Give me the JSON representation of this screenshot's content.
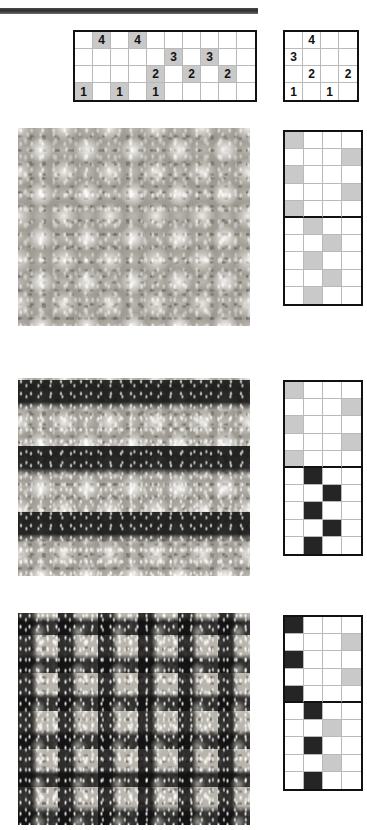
{
  "page": {
    "top_rule": "decorative-horizontal-rule"
  },
  "charts": {
    "main": {
      "name": "stitch-chart-main",
      "columns": 10,
      "rows": 4,
      "cells": [
        [
          "",
          "4",
          "",
          "4",
          "",
          "",
          "",
          "",
          "",
          ""
        ],
        [
          "",
          "",
          "",
          "",
          "",
          "3",
          "",
          "3",
          "",
          ""
        ],
        [
          "",
          "",
          "",
          "",
          "2",
          "",
          "2",
          "",
          "2",
          ""
        ],
        [
          "1",
          "",
          "1",
          "",
          "1",
          "",
          "",
          "",
          "",
          ""
        ]
      ],
      "shaded": [
        [
          0,
          1,
          0,
          1,
          0,
          0,
          0,
          0,
          0,
          0
        ],
        [
          0,
          0,
          0,
          0,
          0,
          1,
          0,
          1,
          0,
          0
        ],
        [
          0,
          0,
          0,
          0,
          1,
          0,
          1,
          0,
          1,
          0
        ],
        [
          1,
          0,
          1,
          0,
          1,
          0,
          0,
          0,
          0,
          0
        ]
      ]
    },
    "side": {
      "name": "stitch-chart-repeat",
      "columns": 4,
      "rows": 4,
      "cells": [
        [
          "",
          "4",
          "",
          ""
        ],
        [
          "3",
          "",
          "",
          ""
        ],
        [
          "",
          "2",
          "",
          "2"
        ],
        [
          "1",
          "",
          "1",
          ""
        ]
      ],
      "shaded": [
        [
          0,
          0,
          0,
          0
        ],
        [
          0,
          0,
          0,
          0
        ],
        [
          0,
          0,
          0,
          0
        ],
        [
          0,
          0,
          0,
          0
        ]
      ]
    },
    "pattern_a": {
      "name": "stitch-chart-swatch-a",
      "columns": 4,
      "rows": 10,
      "legend": {
        "light": "#ffffff",
        "mid": "#c9c9c9"
      },
      "grid": [
        [
          "g",
          "w",
          "w",
          "w"
        ],
        [
          "w",
          "w",
          "w",
          "g"
        ],
        [
          "g",
          "w",
          "w",
          "w"
        ],
        [
          "w",
          "w",
          "w",
          "g"
        ],
        [
          "g",
          "w",
          "w",
          "w"
        ],
        [
          "w",
          "g",
          "w",
          "w"
        ],
        [
          "w",
          "w",
          "g",
          "w"
        ],
        [
          "w",
          "g",
          "w",
          "w"
        ],
        [
          "w",
          "w",
          "g",
          "w"
        ],
        [
          "w",
          "g",
          "w",
          "w"
        ]
      ],
      "divider_after_row": 5
    },
    "pattern_b": {
      "name": "stitch-chart-swatch-b",
      "columns": 4,
      "rows": 10,
      "legend": {
        "light": "#ffffff",
        "mid": "#c9c9c9",
        "dark": "#252525"
      },
      "grid": [
        [
          "g",
          "w",
          "w",
          "w"
        ],
        [
          "w",
          "w",
          "w",
          "g"
        ],
        [
          "g",
          "w",
          "w",
          "w"
        ],
        [
          "w",
          "w",
          "w",
          "g"
        ],
        [
          "g",
          "w",
          "w",
          "w"
        ],
        [
          "w",
          "d",
          "w",
          "w"
        ],
        [
          "w",
          "w",
          "d",
          "w"
        ],
        [
          "w",
          "d",
          "w",
          "w"
        ],
        [
          "w",
          "w",
          "d",
          "w"
        ],
        [
          "w",
          "d",
          "w",
          "w"
        ]
      ],
      "divider_after_row": 5
    },
    "pattern_c": {
      "name": "stitch-chart-swatch-c",
      "columns": 4,
      "rows": 10,
      "legend": {
        "light": "#ffffff",
        "mid": "#c9c9c9",
        "dark": "#252525"
      },
      "grid": [
        [
          "d",
          "w",
          "w",
          "w"
        ],
        [
          "w",
          "w",
          "w",
          "g"
        ],
        [
          "d",
          "w",
          "w",
          "w"
        ],
        [
          "w",
          "w",
          "w",
          "g"
        ],
        [
          "d",
          "w",
          "w",
          "w"
        ],
        [
          "w",
          "d",
          "w",
          "w"
        ],
        [
          "w",
          "w",
          "g",
          "w"
        ],
        [
          "w",
          "d",
          "w",
          "w"
        ],
        [
          "w",
          "w",
          "g",
          "w"
        ],
        [
          "w",
          "d",
          "w",
          "w"
        ]
      ],
      "divider_after_row": 5
    }
  },
  "swatches": [
    {
      "name": "swatch-photo-a",
      "description": "light textured star-stitch knit swatch"
    },
    {
      "name": "swatch-photo-b",
      "description": "knit swatch with dark horizontal welt bands"
    },
    {
      "name": "swatch-photo-c",
      "description": "knit swatch with dark lattice check pattern"
    }
  ]
}
